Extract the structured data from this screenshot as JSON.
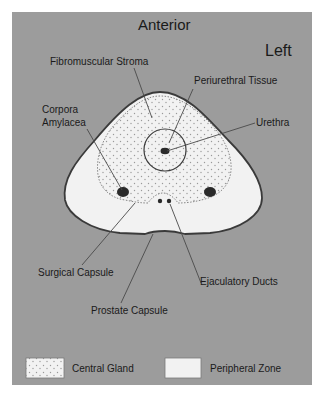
{
  "diagram": {
    "orientation": {
      "top": "Anterior",
      "side": "Left"
    },
    "labels": {
      "fibromuscular_stroma": "Fibromuscular Stroma",
      "periurethral_tissue": "Periurethral Tissue",
      "corpora_amylacea_line1": "Corpora",
      "corpora_amylacea_line2": "Amylacea",
      "urethra": "Urethra",
      "surgical_capsule": "Surgical Capsule",
      "ejaculatory_ducts": "Ejaculatory Ducts",
      "prostate_capsule": "Prostate Capsule"
    },
    "legend": [
      {
        "label": "Central Gland",
        "pattern": "stippled"
      },
      {
        "label": "Peripheral Zone",
        "pattern": "plain"
      }
    ],
    "colors": {
      "background": "#9c9c9c",
      "gland_fill": "#f2f2f2",
      "outline": "#3a3a3a",
      "dots": "#9a9a9a"
    }
  }
}
